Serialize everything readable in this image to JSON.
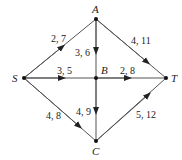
{
  "nodes": [
    {
      "id": "A",
      "label": "A",
      "x": 96,
      "y": 19
    },
    {
      "id": "S",
      "label": "S",
      "x": 24,
      "y": 78
    },
    {
      "id": "B",
      "label": "B",
      "x": 96,
      "y": 78
    },
    {
      "id": "T",
      "label": "T",
      "x": 166,
      "y": 78
    },
    {
      "id": "C",
      "label": "C",
      "x": 96,
      "y": 141
    }
  ],
  "edges": [
    {
      "from": "S",
      "to": "A",
      "label": "2, 7"
    },
    {
      "from": "A",
      "to": "B",
      "label": "3, 6"
    },
    {
      "from": "A",
      "to": "T",
      "label": "4, 11"
    },
    {
      "from": "S",
      "to": "B",
      "label": "3, 5"
    },
    {
      "from": "B",
      "to": "T",
      "label": "2, 8"
    },
    {
      "from": "S",
      "to": "C",
      "label": "4, 8"
    },
    {
      "from": "B",
      "to": "C",
      "label": "4, 9"
    },
    {
      "from": "C",
      "to": "T",
      "label": "5, 12"
    }
  ]
}
